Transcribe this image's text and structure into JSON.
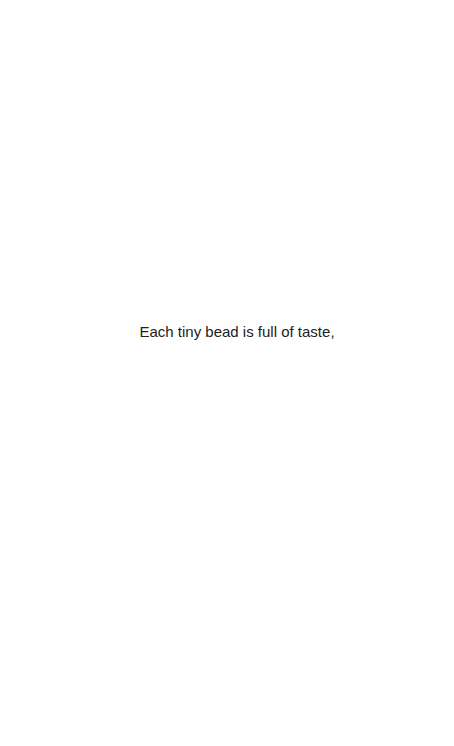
{
  "page": {
    "background": "#ffffff",
    "text_color": "#222222",
    "caption": "Each tiny bead is full of taste,"
  }
}
